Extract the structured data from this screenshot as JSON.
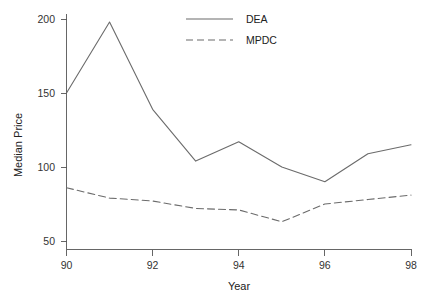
{
  "chart_data": {
    "type": "line",
    "title": "",
    "xlabel": "Year",
    "ylabel": "Median Price",
    "x": [
      90,
      91,
      92,
      93,
      94,
      95,
      96,
      97,
      98
    ],
    "xlim": [
      90,
      98
    ],
    "ylim": [
      45,
      205
    ],
    "grid": false,
    "legend_position": "top-center",
    "xticks": [
      "90",
      "92",
      "94",
      "96",
      "98"
    ],
    "xtick_values": [
      90,
      92,
      94,
      96,
      98
    ],
    "yticks": [
      "50",
      "100",
      "150",
      "200"
    ],
    "ytick_values": [
      50,
      100,
      150,
      200
    ],
    "series": [
      {
        "name": "DEA",
        "style": "solid",
        "color": "#6b6b6b",
        "values": [
          150,
          198,
          139,
          104,
          117,
          100,
          90,
          109,
          115
        ]
      },
      {
        "name": "MPDC",
        "style": "dashed",
        "color": "#6b6b6b",
        "values": [
          86,
          79,
          77,
          72,
          71,
          63,
          75,
          78,
          81
        ]
      }
    ]
  },
  "legend": {
    "entries": [
      {
        "label": "DEA"
      },
      {
        "label": "MPDC"
      }
    ]
  },
  "axes": {
    "x_title": "Year",
    "y_title": "Median Price"
  }
}
